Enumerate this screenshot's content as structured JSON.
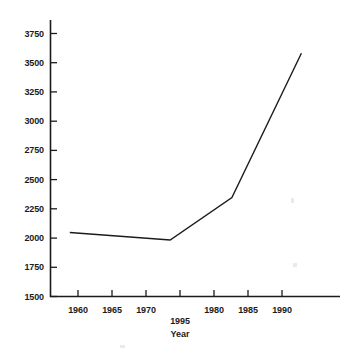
{
  "chart_data": {
    "type": "line",
    "title": "",
    "subtitle": "",
    "xlabel": "Year",
    "ylabel": "",
    "grid": false,
    "legend": null,
    "xlim": [
      1957.5,
      1995.0
    ],
    "ylim": [
      1500,
      3875
    ],
    "y_ticks": [
      1500,
      1750,
      2000,
      2250,
      2500,
      2750,
      3000,
      3250,
      3500,
      3750
    ],
    "y_tick_labels": [
      "1500",
      "1750",
      "2000",
      "2250",
      "2500",
      "2750",
      "3000",
      "3250",
      "3500",
      "3750"
    ],
    "x_ticks": [
      1960,
      1965,
      1970,
      1975,
      1980,
      1985,
      1990
    ],
    "x_tick_labels_row1": [
      "1960",
      "1965",
      "1970",
      "",
      "1980",
      "1985",
      "1990"
    ],
    "x_tick_labels_row2": [
      "",
      "",
      "",
      "1995",
      "",
      "",
      ""
    ],
    "x": [
      1960,
      1973,
      1981,
      1990
    ],
    "values": [
      2050,
      1985,
      2350,
      3590
    ],
    "series": [
      {
        "name": "",
        "x": [
          1960,
          1973,
          1981,
          1990
        ],
        "values": [
          2050,
          1985,
          2350,
          3590
        ],
        "color": "#1b1b1b",
        "line_width": 1.4
      }
    ],
    "annotations": [],
    "axis_color": "#1b1b1b",
    "background": "#ffffff"
  },
  "axis": {
    "x_title": "Year"
  },
  "y_labels": {
    "t0": "1500",
    "t1": "1750",
    "t2": "2000",
    "t3": "2250",
    "t4": "2500",
    "t5": "2750",
    "t6": "3000",
    "t7": "3250",
    "t8": "3500",
    "t9": "3750"
  },
  "x_labels": {
    "r1c0": "1960",
    "r1c1": "1965",
    "r1c2": "1970",
    "r1c4": "1980",
    "r1c5": "1985",
    "r1c6": "1990",
    "r2c3": "1995"
  }
}
